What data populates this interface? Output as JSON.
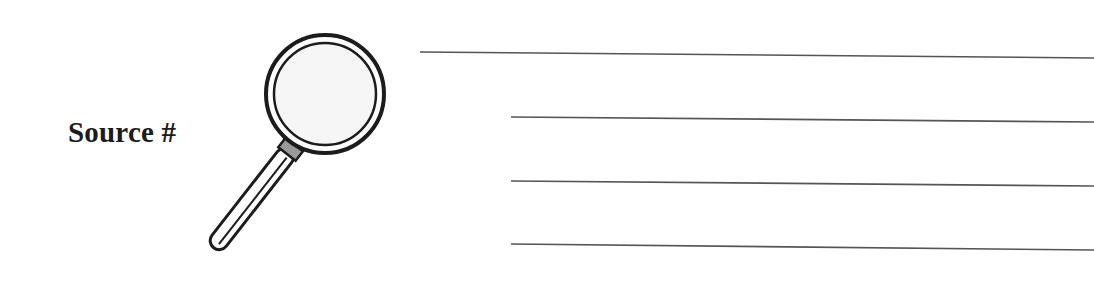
{
  "worksheet": {
    "label": "Source #",
    "icon": "magnifying-glass-icon",
    "lines": [
      {
        "x1": 420,
        "y1": 52,
        "x2": 1094,
        "y2": 58
      },
      {
        "x1": 511,
        "y1": 117,
        "x2": 1094,
        "y2": 122
      },
      {
        "x1": 511,
        "y1": 181,
        "x2": 1094,
        "y2": 186
      },
      {
        "x1": 511,
        "y1": 244,
        "x2": 1094,
        "y2": 250
      }
    ],
    "colors": {
      "ink": "#1c1c1c",
      "line": "#555555",
      "collar": "#9a9a9a",
      "lens": "#f6f6f6"
    }
  }
}
